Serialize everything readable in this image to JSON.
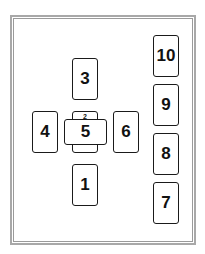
{
  "diagram": {
    "type": "tarot-spread-layout",
    "frame": {
      "style": "double-line",
      "color": "#a8a8a8"
    },
    "cards": [
      {
        "id": "1",
        "label": "1",
        "orientation": "vertical",
        "x": 72,
        "y": 164
      },
      {
        "id": "2",
        "label": "2",
        "orientation": "vertical",
        "x": 72,
        "y": 111
      },
      {
        "id": "3",
        "label": "3",
        "orientation": "vertical",
        "x": 72,
        "y": 58
      },
      {
        "id": "4",
        "label": "4",
        "orientation": "vertical",
        "x": 32,
        "y": 111
      },
      {
        "id": "5",
        "label": "5",
        "orientation": "horizontal",
        "x": 64,
        "y": 119
      },
      {
        "id": "6",
        "label": "6",
        "orientation": "vertical",
        "x": 113,
        "y": 111
      },
      {
        "id": "7",
        "label": "7",
        "orientation": "vertical",
        "x": 153,
        "y": 182
      },
      {
        "id": "8",
        "label": "8",
        "orientation": "vertical",
        "x": 153,
        "y": 133
      },
      {
        "id": "9",
        "label": "9",
        "orientation": "vertical",
        "x": 153,
        "y": 84
      },
      {
        "id": "10",
        "label": "10",
        "orientation": "vertical",
        "x": 153,
        "y": 35
      }
    ]
  },
  "labels": {
    "card_1": "1",
    "card_2": "2",
    "card_3": "3",
    "card_4": "4",
    "card_5": "5",
    "card_6": "6",
    "card_7": "7",
    "card_8": "8",
    "card_9": "9",
    "card_10": "10"
  }
}
